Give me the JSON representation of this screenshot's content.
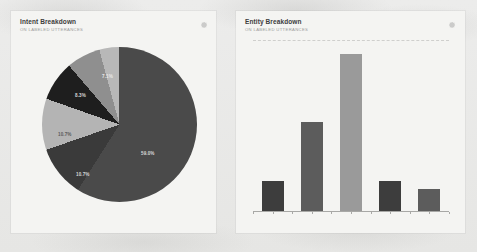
{
  "background": {
    "color": "#e9e9e7"
  },
  "panels": {
    "intent": {
      "title": "Intent Breakdown",
      "subtitle": "ON LABELED UTTERANCES",
      "settings_icon": "gear-icon"
    },
    "entity": {
      "title": "Entity Breakdown",
      "subtitle": "ON LABELED UTTERANCES",
      "settings_icon": "gear-icon"
    }
  },
  "chart_data": [
    {
      "type": "pie",
      "title": "Intent Breakdown",
      "subtitle": "ON LABELED UTTERANCES",
      "labels": [
        "59.0%",
        "10.7%",
        "10.7%",
        "8.3%",
        "7.1%",
        "4.2%"
      ],
      "values": [
        59.0,
        10.7,
        10.7,
        8.3,
        7.1,
        4.2
      ],
      "colors": [
        "#4a4a4a",
        "#3a3a3a",
        "#b4b4b4",
        "#1e1e1e",
        "#8f8f8f",
        "#b8b8b8"
      ],
      "label_colors": [
        "#d8d8d8",
        "#d8d8d8",
        "#5a5a5a",
        "#d8d8d8",
        "#e8e8e8",
        "#5a5a5a"
      ],
      "start_angle_deg": 0,
      "legend": "none",
      "grid": false
    },
    {
      "type": "bar",
      "title": "Entity Breakdown",
      "subtitle": "ON LABELED UTTERANCES",
      "categories": [
        "1",
        "2",
        "3",
        "4",
        "5"
      ],
      "values": [
        19,
        56,
        99,
        19,
        14
      ],
      "colors": [
        "#3d3d3d",
        "#5c5c5c",
        "#9a9a9a",
        "#3d3d3d",
        "#5c5c5c"
      ],
      "xlabel": "",
      "ylabel": "",
      "ylim": [
        0,
        108
      ],
      "gridlines": [
        108
      ],
      "grid": true,
      "legend": "none"
    }
  ]
}
